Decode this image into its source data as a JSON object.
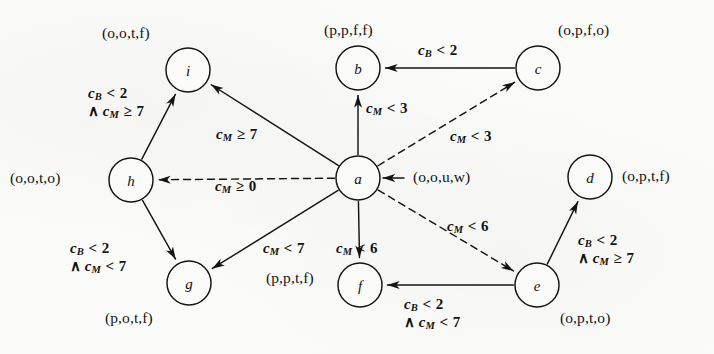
{
  "figure": {
    "type": "state-transition-diagram",
    "background_color": "#fbfbfa",
    "ink_color": "#131313"
  },
  "nodes": [
    {
      "id": "i",
      "label": "i",
      "cx": 188,
      "cy": 70,
      "r": 22,
      "state_label": "(o,o,t,f)",
      "state_x": 102,
      "state_y": 25,
      "state_anchor": "left"
    },
    {
      "id": "b",
      "label": "b",
      "cx": 358,
      "cy": 68,
      "r": 22,
      "state_label": "(p,p,f,f)",
      "state_x": 324,
      "state_y": 22,
      "state_anchor": "left"
    },
    {
      "id": "c",
      "label": "c",
      "cx": 538,
      "cy": 68,
      "r": 22,
      "state_label": "(o,p,f,o)",
      "state_x": 558,
      "state_y": 22,
      "state_anchor": "left"
    },
    {
      "id": "h",
      "label": "h",
      "cx": 131,
      "cy": 180,
      "r": 22,
      "state_label": "(o,o,t,o)",
      "state_x": 10,
      "state_y": 170,
      "state_anchor": "left"
    },
    {
      "id": "a",
      "label": "a",
      "cx": 358,
      "cy": 178,
      "r": 22,
      "state_label": "(o,o,u,w)",
      "state_x": 413,
      "state_y": 169,
      "state_anchor": "left"
    },
    {
      "id": "d",
      "label": "d",
      "cx": 590,
      "cy": 177,
      "r": 22,
      "state_label": "(o,p,t,f)",
      "state_x": 622,
      "state_y": 168,
      "state_anchor": "left"
    },
    {
      "id": "g",
      "label": "g",
      "cx": 189,
      "cy": 283,
      "r": 22,
      "state_label": "(p,o,t,f)",
      "state_x": 105,
      "state_y": 310,
      "state_anchor": "left"
    },
    {
      "id": "f",
      "label": "f",
      "cx": 360,
      "cy": 285,
      "r": 22,
      "state_label": "(p,p,t,f)",
      "state_x": 266,
      "state_y": 270,
      "state_anchor": "left"
    },
    {
      "id": "e",
      "label": "e",
      "cx": 537,
      "cy": 285,
      "r": 22,
      "state_label": "(o,p,t,o)",
      "state_x": 560,
      "state_y": 310,
      "state_anchor": "left"
    }
  ],
  "initial_marker": {
    "target": "a",
    "from_x": 404,
    "from_y": 178,
    "to_x": 383,
    "to_y": 178
  },
  "edges": [
    {
      "id": "c-to-b",
      "from": "c",
      "to": "b",
      "style": "solid",
      "guard": {
        "var1": "c",
        "sub1": "B",
        "op": "<",
        "val1": "2"
      },
      "guard_text": "cB < 2",
      "label_x": 418,
      "label_y": 42
    },
    {
      "id": "a-to-b",
      "from": "a",
      "to": "b",
      "style": "solid",
      "guard": {
        "var1": "c",
        "sub1": "M",
        "op": "<",
        "val1": "3"
      },
      "guard_text": "cM < 3",
      "label_x": 366,
      "label_y": 100
    },
    {
      "id": "a-to-c",
      "from": "a",
      "to": "c",
      "style": "dashed",
      "guard": {
        "var1": "c",
        "sub1": "M",
        "op": "<",
        "val1": "3"
      },
      "guard_text": "cM < 3",
      "label_x": 450,
      "label_y": 128
    },
    {
      "id": "a-to-i",
      "from": "a",
      "to": "i",
      "style": "solid",
      "guard": {
        "var1": "c",
        "sub1": "M",
        "op": "≥",
        "val1": "7"
      },
      "guard_text": "cM ≥ 7",
      "label_x": 216,
      "label_y": 126
    },
    {
      "id": "h-to-i",
      "from": "h",
      "to": "i",
      "style": "solid",
      "guard": {
        "var1": "c",
        "sub1": "B",
        "op": "<",
        "val1": "2",
        "var2": "c",
        "sub2": "M",
        "op2": "≥",
        "val2": "7"
      },
      "guard_text": "cB < 2 ∧ cM ≥ 7",
      "label_x": 88,
      "label_y": 85
    },
    {
      "id": "a-to-h",
      "from": "a",
      "to": "h",
      "style": "dashed",
      "guard": {
        "var1": "c",
        "sub1": "M",
        "op": "≥",
        "val1": "0"
      },
      "guard_text": "cM ≥ 0",
      "label_x": 215,
      "label_y": 178
    },
    {
      "id": "h-to-g",
      "from": "h",
      "to": "g",
      "style": "solid",
      "guard": {
        "var1": "c",
        "sub1": "B",
        "op": "<",
        "val1": "2",
        "var2": "c",
        "sub2": "M",
        "op2": "<",
        "val2": "7"
      },
      "guard_text": "cB < 2 ∧ cM < 7",
      "label_x": 70,
      "label_y": 240
    },
    {
      "id": "a-to-g",
      "from": "a",
      "to": "g",
      "style": "solid",
      "guard": {
        "var1": "c",
        "sub1": "M",
        "op": "<",
        "val1": "7"
      },
      "guard_text": "cM < 7",
      "label_x": 263,
      "label_y": 240
    },
    {
      "id": "a-to-f",
      "from": "a",
      "to": "f",
      "style": "solid",
      "guard": {
        "var1": "c",
        "sub1": "M",
        "op": "<",
        "val1": "6"
      },
      "guard_text": "cM < 6",
      "label_x": 336,
      "label_y": 240
    },
    {
      "id": "a-to-e",
      "from": "a",
      "to": "e",
      "style": "dashed",
      "guard": {
        "var1": "c",
        "sub1": "M",
        "op": "<",
        "val1": "6"
      },
      "guard_text": "cM < 6",
      "label_x": 447,
      "label_y": 218
    },
    {
      "id": "e-to-f",
      "from": "e",
      "to": "f",
      "style": "solid",
      "guard": {
        "var1": "c",
        "sub1": "B",
        "op": "<",
        "val1": "2",
        "var2": "c",
        "sub2": "M",
        "op2": "<",
        "val2": "7"
      },
      "guard_text": "cB < 2 ∧ cM < 7",
      "label_x": 404,
      "label_y": 296
    },
    {
      "id": "e-to-d",
      "from": "e",
      "to": "d",
      "style": "solid",
      "guard": {
        "var1": "c",
        "sub1": "B",
        "op": "<",
        "val1": "2",
        "var2": "c",
        "sub2": "M",
        "op2": "≥",
        "val2": "7"
      },
      "guard_text": "cB < 2 ∧ cM ≥ 7",
      "label_x": 578,
      "label_y": 232
    }
  ]
}
